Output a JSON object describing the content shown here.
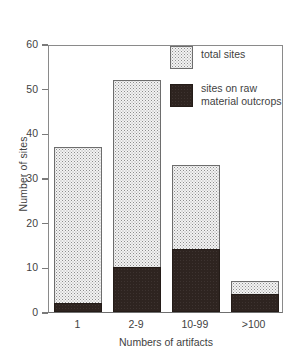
{
  "chart_data": {
    "type": "bar",
    "stacked": true,
    "title": "",
    "xlabel": "Numbers of artifacts",
    "ylabel": "Number of sites",
    "categories": [
      "1",
      "2-9",
      "10-99",
      ">100"
    ],
    "ylim": [
      0,
      60
    ],
    "yticks": [
      0,
      10,
      20,
      30,
      40,
      50,
      60
    ],
    "ytick_labels": [
      "0",
      "10",
      "20",
      "30",
      "40",
      "50",
      "60"
    ],
    "grid": false,
    "legend_position": "top-right",
    "series": [
      {
        "name": "total sites",
        "legend_label": "total sites",
        "fill": "stipple-light-gray",
        "color": "#f3f3f3",
        "values": [
          37,
          52,
          33,
          7
        ]
      },
      {
        "name": "sites on raw material outcrops",
        "legend_label": "sites on raw\nmaterial outcrops",
        "fill": "solid-dark-brown",
        "color": "#2e2420",
        "values": [
          2,
          10,
          14,
          4
        ]
      }
    ]
  },
  "axis": {
    "frame_color": "#8a8a8a",
    "text_color": "#3f3f3f"
  }
}
